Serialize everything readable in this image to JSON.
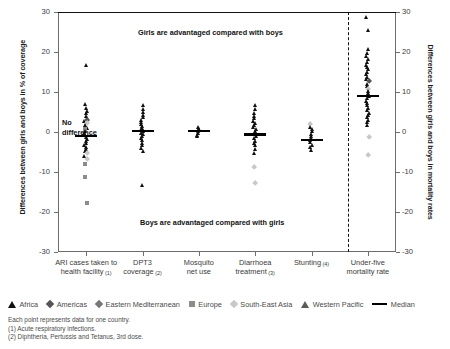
{
  "chart_data": {
    "type": "scatter",
    "title": "",
    "ylabel_left": "Differences between girls and boys in % of coverage",
    "ylabel_right": "Differences between girls and boys in mortality rates",
    "xlabel": "",
    "ylim": [
      -30,
      30
    ],
    "yticks": [
      30,
      20,
      10,
      0,
      -10,
      -20,
      -30
    ],
    "ytick_labels_left": [
      "30",
      "20",
      "10",
      "0",
      "-10",
      "-20",
      "-30"
    ],
    "ytick_labels_right": [
      "30",
      "20",
      "10",
      "0",
      "-10",
      "-20",
      "-30"
    ],
    "grid": false,
    "zero_reference_line": 0,
    "divider_after_category": "Stunting (4)",
    "annotations": [
      {
        "text": "Girls are advantaged compared with boys",
        "y": 25
      },
      {
        "text": "Boys are advantaged compared with girls",
        "y": -22
      },
      {
        "text": "No\ndifference",
        "y": 0
      }
    ],
    "no_difference_label_line1": "No",
    "no_difference_label_line2": "difference",
    "categories": [
      {
        "label": "ARI cases taken to\nhealth facility",
        "note": "(1)",
        "median": -1.0
      },
      {
        "label": "DPT3\ncoverage",
        "note": "(2)",
        "median": 0.2
      },
      {
        "label": "Mosquito\nnet use",
        "note": "",
        "median": 0.3
      },
      {
        "label": "Diarrhoea\ntreatment",
        "note": "(3)",
        "median": -0.6
      },
      {
        "label": "Stunting",
        "note": "(4)",
        "median": -2.0
      },
      {
        "label": "Under-five\nmortality rate",
        "note": "",
        "median": 9.0
      }
    ],
    "series": [
      {
        "name": "ARI cases taken to health facility (1)",
        "points": [
          {
            "v": 16.6,
            "r": "Africa"
          },
          {
            "v": 7.0,
            "r": "Africa"
          },
          {
            "v": 6.0,
            "r": "Africa"
          },
          {
            "v": 5.2,
            "r": "Africa"
          },
          {
            "v": 4.6,
            "r": "Africa"
          },
          {
            "v": 4.0,
            "r": "Africa"
          },
          {
            "v": 3.4,
            "r": "Africa"
          },
          {
            "v": 3.0,
            "r": "Americas"
          },
          {
            "v": 2.6,
            "r": "Africa"
          },
          {
            "v": 2.2,
            "r": "South-East Asia"
          },
          {
            "v": 1.8,
            "r": "Africa"
          },
          {
            "v": 1.4,
            "r": "Africa"
          },
          {
            "v": 1.0,
            "r": "Africa"
          },
          {
            "v": 0.6,
            "r": "Europe"
          },
          {
            "v": 0.2,
            "r": "Africa"
          },
          {
            "v": -0.3,
            "r": "Africa"
          },
          {
            "v": -0.8,
            "r": "Africa"
          },
          {
            "v": -1.2,
            "r": "Africa"
          },
          {
            "v": -1.8,
            "r": "Africa"
          },
          {
            "v": -2.3,
            "r": "Africa"
          },
          {
            "v": -2.8,
            "r": "Africa"
          },
          {
            "v": -3.3,
            "r": "Africa"
          },
          {
            "v": -3.8,
            "r": "Africa"
          },
          {
            "v": -4.3,
            "r": "Africa"
          },
          {
            "v": -4.9,
            "r": "Africa"
          },
          {
            "v": -5.4,
            "r": "South-East Asia"
          },
          {
            "v": -6.0,
            "r": "Africa"
          },
          {
            "v": -6.8,
            "r": "South-East Asia"
          },
          {
            "v": -8.0,
            "r": "Europe"
          },
          {
            "v": -11.2,
            "r": "Europe"
          },
          {
            "v": -17.8,
            "r": "Europe"
          }
        ]
      },
      {
        "name": "DPT3 coverage (2)",
        "points": [
          {
            "v": 6.6,
            "r": "Africa"
          },
          {
            "v": 5.8,
            "r": "Africa"
          },
          {
            "v": 5.0,
            "r": "Africa"
          },
          {
            "v": 4.2,
            "r": "Africa"
          },
          {
            "v": 3.6,
            "r": "Africa"
          },
          {
            "v": 3.0,
            "r": "Africa"
          },
          {
            "v": 2.4,
            "r": "Africa"
          },
          {
            "v": 1.9,
            "r": "Africa"
          },
          {
            "v": 1.4,
            "r": "Africa"
          },
          {
            "v": 1.0,
            "r": "Africa"
          },
          {
            "v": 0.6,
            "r": "Africa"
          },
          {
            "v": 0.2,
            "r": "Africa"
          },
          {
            "v": -0.2,
            "r": "Africa"
          },
          {
            "v": -0.6,
            "r": "Africa"
          },
          {
            "v": -1.1,
            "r": "Africa"
          },
          {
            "v": -1.6,
            "r": "Africa"
          },
          {
            "v": -2.1,
            "r": "Africa"
          },
          {
            "v": -2.7,
            "r": "Africa"
          },
          {
            "v": -3.3,
            "r": "Africa"
          },
          {
            "v": -4.0,
            "r": "Africa"
          },
          {
            "v": -4.8,
            "r": "Africa"
          },
          {
            "v": -13.4,
            "r": "Africa"
          }
        ]
      },
      {
        "name": "Mosquito net use",
        "points": [
          {
            "v": 1.2,
            "r": "Africa"
          },
          {
            "v": 0.8,
            "r": "Africa"
          },
          {
            "v": 0.4,
            "r": "Africa"
          },
          {
            "v": 0.1,
            "r": "Africa"
          },
          {
            "v": -0.3,
            "r": "Africa"
          },
          {
            "v": -0.7,
            "r": "Africa"
          },
          {
            "v": -1.1,
            "r": "Africa"
          }
        ]
      },
      {
        "name": "Diarrhoea treatment (3)",
        "points": [
          {
            "v": 6.6,
            "r": "Africa"
          },
          {
            "v": 5.6,
            "r": "Africa"
          },
          {
            "v": 4.8,
            "r": "Africa"
          },
          {
            "v": 4.0,
            "r": "Africa"
          },
          {
            "v": 3.4,
            "r": "Africa"
          },
          {
            "v": 2.8,
            "r": "Africa"
          },
          {
            "v": 2.2,
            "r": "Africa"
          },
          {
            "v": 1.7,
            "r": "Africa"
          },
          {
            "v": 1.2,
            "r": "Africa"
          },
          {
            "v": 0.7,
            "r": "Africa"
          },
          {
            "v": 0.2,
            "r": "Africa"
          },
          {
            "v": -0.4,
            "r": "Africa"
          },
          {
            "v": -1.0,
            "r": "Africa"
          },
          {
            "v": -1.6,
            "r": "Africa"
          },
          {
            "v": -2.2,
            "r": "Africa"
          },
          {
            "v": -2.8,
            "r": "Africa"
          },
          {
            "v": -3.4,
            "r": "Africa"
          },
          {
            "v": -4.2,
            "r": "Africa"
          },
          {
            "v": -5.2,
            "r": "Africa"
          },
          {
            "v": -8.8,
            "r": "South-East Asia"
          },
          {
            "v": -12.8,
            "r": "South-East Asia"
          }
        ]
      },
      {
        "name": "Stunting (4)",
        "points": [
          {
            "v": 2.0,
            "r": "South-East Asia"
          },
          {
            "v": 1.2,
            "r": "Africa"
          },
          {
            "v": 0.6,
            "r": "Africa"
          },
          {
            "v": 0.1,
            "r": "Africa"
          },
          {
            "v": -0.5,
            "r": "Africa"
          },
          {
            "v": -1.1,
            "r": "Africa"
          },
          {
            "v": -1.6,
            "r": "Africa"
          },
          {
            "v": -2.1,
            "r": "Africa"
          },
          {
            "v": -2.6,
            "r": "Africa"
          },
          {
            "v": -3.2,
            "r": "Africa"
          },
          {
            "v": -3.8,
            "r": "Africa"
          },
          {
            "v": -4.6,
            "r": "Africa"
          }
        ]
      },
      {
        "name": "Under-five mortality rate",
        "points": [
          {
            "v": 28.8,
            "r": "Africa"
          },
          {
            "v": 25.4,
            "r": "Africa"
          },
          {
            "v": 20.8,
            "r": "Africa"
          },
          {
            "v": 19.8,
            "r": "Africa"
          },
          {
            "v": 19.0,
            "r": "Africa"
          },
          {
            "v": 18.2,
            "r": "Africa"
          },
          {
            "v": 17.4,
            "r": "Africa"
          },
          {
            "v": 16.8,
            "r": "Africa"
          },
          {
            "v": 16.2,
            "r": "Africa"
          },
          {
            "v": 15.6,
            "r": "Africa"
          },
          {
            "v": 15.0,
            "r": "Africa"
          },
          {
            "v": 14.4,
            "r": "Africa"
          },
          {
            "v": 13.8,
            "r": "Africa"
          },
          {
            "v": 13.2,
            "r": "Africa"
          },
          {
            "v": 12.6,
            "r": "Americas"
          },
          {
            "v": 12.0,
            "r": "Africa"
          },
          {
            "v": 11.4,
            "r": "Africa"
          },
          {
            "v": 10.8,
            "r": "South-East Asia"
          },
          {
            "v": 10.2,
            "r": "Africa"
          },
          {
            "v": 9.6,
            "r": "Africa"
          },
          {
            "v": 9.0,
            "r": "Africa"
          },
          {
            "v": 8.4,
            "r": "Africa"
          },
          {
            "v": 7.8,
            "r": "Africa"
          },
          {
            "v": 7.2,
            "r": "Africa"
          },
          {
            "v": 6.6,
            "r": "Africa"
          },
          {
            "v": 6.0,
            "r": "Africa"
          },
          {
            "v": 5.4,
            "r": "Africa"
          },
          {
            "v": 4.8,
            "r": "Africa"
          },
          {
            "v": 4.2,
            "r": "Africa"
          },
          {
            "v": 3.6,
            "r": "Africa"
          },
          {
            "v": 3.0,
            "r": "Africa"
          },
          {
            "v": 2.4,
            "r": "Africa"
          },
          {
            "v": 1.6,
            "r": "Africa"
          },
          {
            "v": -1.2,
            "r": "South-East Asia"
          },
          {
            "v": -5.8,
            "r": "South-East Asia"
          }
        ]
      }
    ],
    "legend": {
      "position": "below-axis",
      "entries": [
        {
          "label": "Africa",
          "marker": "triangle",
          "color": "#111111"
        },
        {
          "label": "Americas",
          "marker": "diamond",
          "color": "#555555"
        },
        {
          "label": "Eastern Mediterranean",
          "marker": "diamond",
          "color": "#777777"
        },
        {
          "label": "Europe",
          "marker": "square",
          "color": "#8c8c8c"
        },
        {
          "label": "South-East Asia",
          "marker": "diamond",
          "color": "#c8c8c8"
        },
        {
          "label": "Western Pacific",
          "marker": "triangle",
          "color": "#5a5a5a"
        },
        {
          "label": "Median",
          "marker": "line",
          "color": "#000000"
        }
      ]
    },
    "notes": [
      "Each point represents data for one country.",
      "(1) Acute respiratory infections.",
      "(2) Diphtheria, Pertussis and Tetanus, 3rd dose."
    ]
  }
}
